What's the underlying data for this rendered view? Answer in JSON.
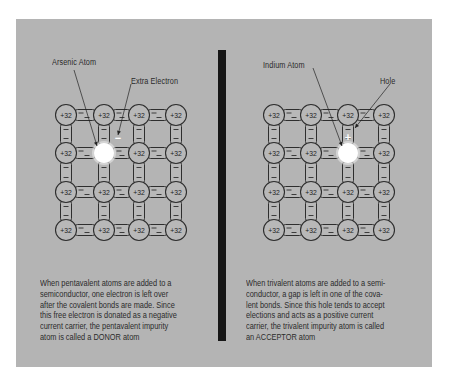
{
  "colors": {
    "panel_bg": "#b4b4b4",
    "divider": "#161616",
    "atom_fill": "#b8b8b8",
    "stroke": "#2e2e2e",
    "impurity": "#ffffff"
  },
  "atom_charge_label": "+32",
  "bond_symbol": "—",
  "left": {
    "title": "N-type doping (Arsenic)",
    "labels": {
      "impurity_atom": "Arsenic Atom",
      "carrier": "Extra Electron"
    },
    "carrier_symbol": "−",
    "impurity_position": {
      "row": 1,
      "col": 1
    },
    "caption_lines": [
      "When pentavalent atoms are added to a",
      "semiconductor, one electron is left over",
      "after the covalent bonds are made. Since",
      "this free electron is donated as a negative",
      "current carrier, the pentavalent impurity",
      "atom is called a DONOR atom"
    ]
  },
  "right": {
    "title": "P-type doping (Indium)",
    "labels": {
      "impurity_atom": "Indium Atom",
      "carrier": "Hole"
    },
    "carrier_symbol": "+",
    "impurity_position": {
      "row": 1,
      "col": 2
    },
    "caption_lines": [
      "When trivalent atoms are added to a semi-",
      "conductor, a gap is left in one of the cova-",
      "lent bonds. Since this hole tends to accept",
      "elections and acts as a positive current",
      "carrier, the trivalent impurity atom is called",
      "an ACCEPTOR atom"
    ]
  },
  "lattice": {
    "rows": 4,
    "cols": 4
  }
}
